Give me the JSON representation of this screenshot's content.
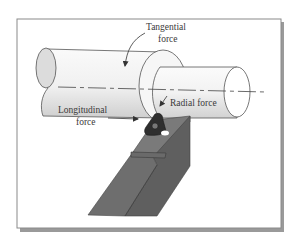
{
  "diagram": {
    "labels": {
      "tangential_line1": "Tangential",
      "tangential_line2": "force",
      "radial": "Radial force",
      "longitudinal_line1": "Longitudinal",
      "longitudinal_line2": "force"
    },
    "components": {
      "workpiece_large": "Workpiece (uncut diameter)",
      "workpiece_small": "Workpiece (machined diameter)",
      "axis": "Centerline",
      "insert": "Cutting insert",
      "holder": "Tool holder"
    },
    "colors": {
      "outline": "#555555",
      "cylinder_fill": "#f4f4f4",
      "cylinder_shade": "#d8d8d8",
      "end_face": "#dcdcdc",
      "holder_top": "#7a7a7a",
      "holder_front": "#6a6a6a",
      "holder_side": "#5e5e5e",
      "insert": "#2e2e2e",
      "frame": "#8a8a8a"
    }
  }
}
